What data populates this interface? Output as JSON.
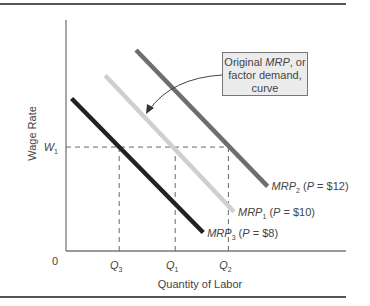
{
  "chart_data": {
    "type": "line",
    "title": "",
    "xlabel": "Quantity of Labor",
    "ylabel": "Wage Rate",
    "origin_label": "0",
    "xlim": [
      0,
      100
    ],
    "ylim": [
      0,
      100
    ],
    "grid": false,
    "wage_level": {
      "label_main": "W",
      "label_sub": "1",
      "y": 45
    },
    "quantity_markers": [
      {
        "label_main": "Q",
        "label_sub": "3",
        "x": 19
      },
      {
        "label_main": "Q",
        "label_sub": "1",
        "x": 39
      },
      {
        "label_main": "Q",
        "label_sub": "2",
        "x": 58
      }
    ],
    "series": [
      {
        "name": "MRP2",
        "label_main": "MRP",
        "label_sub": "2",
        "label_price": " (P = $12)",
        "color": "#6e6e6e",
        "points": [
          [
            25,
            87
          ],
          [
            72,
            28
          ]
        ]
      },
      {
        "name": "MRP1",
        "label_main": "MRP",
        "label_sub": "1",
        "label_price": " (P = $10)",
        "color": "#cfcfcf",
        "points": [
          [
            14,
            76
          ],
          [
            60,
            17
          ]
        ]
      },
      {
        "name": "MRP3",
        "label_main": "MRP",
        "label_sub": "3",
        "label_price": " (P = $8)",
        "color": "#222222",
        "points": [
          [
            2,
            66
          ],
          [
            49,
            8
          ]
        ]
      }
    ],
    "annotation": {
      "line1_pre": "Original ",
      "line1_italic": "MRP",
      "line1_post": ", or",
      "line2": "factor demand,",
      "line3": "curve",
      "points_to": "MRP1"
    }
  }
}
